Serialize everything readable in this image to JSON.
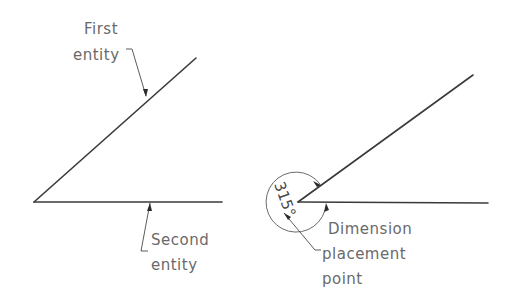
{
  "left_figure": {
    "first_label_line1": "First",
    "first_label_line2": "entity",
    "second_label_line1": "Second",
    "second_label_line2": "entity"
  },
  "right_figure": {
    "dimension_value": "315°",
    "placement_label_line1": "Dimension",
    "placement_label_line2": "placement",
    "placement_label_line3": "point"
  },
  "colors": {
    "line": "#3a3a3a",
    "text": "#6a6a6a",
    "background": "#ffffff"
  }
}
